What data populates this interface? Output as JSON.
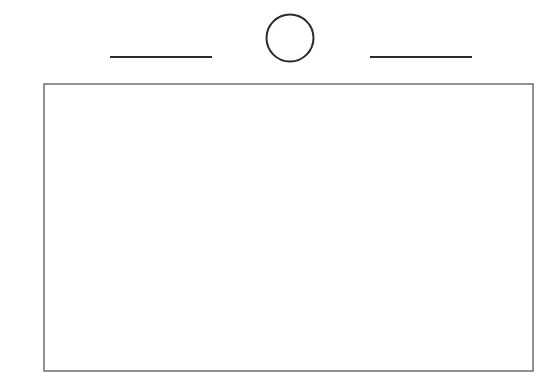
{
  "figure": {
    "canvas": {
      "width": 559,
      "height": 383,
      "background_color": "#ffffff"
    },
    "colors": {
      "dark_stroke": "#2b2b2b",
      "gray_stroke": "#6d6d6d",
      "fill": "#ffffff"
    },
    "elements": {
      "circle": {
        "name": "circle-outline",
        "center_x": 290,
        "center_y": 38,
        "radius": 23.5,
        "stroke_width": 2,
        "stroke_color": "#2b2b2b",
        "fill": "none"
      },
      "left_rule": {
        "name": "left-horizontal-rule",
        "x1": 110,
        "y1": 57,
        "x2": 212,
        "y2": 57,
        "length": 102,
        "stroke_width": 2,
        "stroke_color": "#2b2b2b"
      },
      "right_rule": {
        "name": "right-horizontal-rule",
        "x1": 370,
        "y1": 57,
        "x2": 472,
        "y2": 57,
        "length": 102,
        "stroke_width": 2,
        "stroke_color": "#2b2b2b"
      },
      "rectangle": {
        "name": "main-rectangle",
        "x": 44,
        "y": 84,
        "width": 489,
        "height": 287,
        "stroke_width": 1.5,
        "stroke_color": "#6d6d6d",
        "fill": "#ffffff"
      }
    }
  }
}
